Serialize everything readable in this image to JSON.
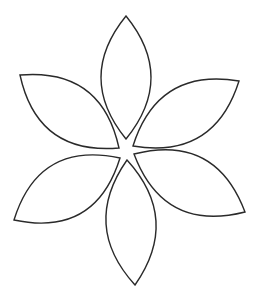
{
  "figure": {
    "width": 260,
    "height": 299,
    "background": "#ffffff",
    "stroke_color": "#2a2a2a",
    "fill_color": "#ffffff",
    "stroke_width": 1.4,
    "petals": [
      {
        "name": "petal-upper-left",
        "tip": [
          20,
          75
        ],
        "base": [
          119,
          148
        ],
        "bulge": 27
      },
      {
        "name": "petal-upper-right",
        "tip": [
          239,
          81
        ],
        "base": [
          133,
          146
        ],
        "bulge": 27
      },
      {
        "name": "petal-lower-left",
        "tip": [
          14,
          220
        ],
        "base": [
          120,
          158
        ],
        "bulge": 28
      },
      {
        "name": "petal-lower-right",
        "tip": [
          245,
          212
        ],
        "base": [
          134,
          154
        ],
        "bulge": 28
      },
      {
        "name": "petal-bottom",
        "tip": [
          135,
          285
        ],
        "base": [
          127,
          160
        ],
        "bulge": 25
      },
      {
        "name": "petal-top",
        "tip": [
          126,
          16
        ],
        "base": [
          126,
          139
        ],
        "bulge": 25
      }
    ]
  }
}
